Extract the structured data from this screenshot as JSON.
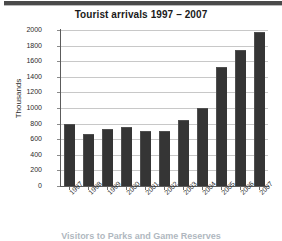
{
  "document": {
    "caption": "Visitors to Parks and Game Reserves"
  },
  "chart_data": {
    "type": "bar",
    "title": "Tourist arrivals 1997 – 2007",
    "xlabel": "",
    "ylabel": "Thousands",
    "categories": [
      "1997",
      "1998",
      "1999",
      "2000",
      "2001",
      "2002",
      "2003",
      "2004",
      "2005",
      "2006",
      "2007"
    ],
    "values": [
      790,
      670,
      730,
      755,
      710,
      710,
      845,
      1005,
      1520,
      1750,
      1975
    ],
    "ylim": [
      0,
      2000
    ],
    "ytick_labels": [
      "2000",
      "1800",
      "1600",
      "1400",
      "1200",
      "1000",
      "800",
      "600",
      "400",
      "200",
      "0"
    ],
    "ytick_values": [
      2000,
      1800,
      1600,
      1400,
      1200,
      1000,
      800,
      600,
      400,
      200,
      0
    ],
    "grid": true,
    "legend": "none",
    "bar_color": "#353535",
    "gridline_color": "#c8c8c8",
    "axis_color": "#5c5c5c",
    "background": "#ffffff"
  }
}
